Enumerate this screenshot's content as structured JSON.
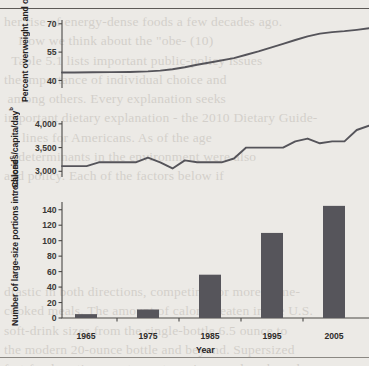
{
  "figure": {
    "background_color": "#eceae6",
    "ink_color": "#4a4845",
    "series_color": "#55545a",
    "bar_color": "#56555b",
    "bleed_text": "her rise of energy-dense foods a few decades ago.\n    How we think about the \"obe- (10)\n  Table 5.1 lists important public-policy issues\nthe importance of individual choice and\n among others. Every explanation seeks\nimportant dietary explanation - the 2010 Dietary Guide-\n     lines for Americans. As of the age\n    determinants in the environment were also\nand policy. Each of the factors below if\n\n\n\n\n\ndrastic in both directions, competing for more home-\ncooked meals. The amount of calories eaten in the U.S.\nsoft-drink sizes from the single-bottle 6.5 ounce to\nthe modern 20-ounce bottle and beyond. Supersized\nfast-food portions, restaurant servings, and packaged\nand snack foods grew alongside. Obesity rose in parallel."
  },
  "chart_data": [
    {
      "type": "line",
      "id": "panel-overweight",
      "title": "",
      "ylabel": "Percent overweight and obese",
      "ylabel_superscript": "a",
      "xlabel": "",
      "yticks": [
        40,
        55,
        70
      ],
      "ytick_labels": [
        "40",
        "55",
        "70"
      ],
      "ylim": [
        36,
        72
      ],
      "xlim": [
        1960,
        2010
      ],
      "grid": false,
      "x": [
        1960,
        1962,
        1965,
        1968,
        1971,
        1974,
        1976,
        1978,
        1980,
        1982,
        1985,
        1988,
        1990,
        1992,
        1994,
        1996,
        1998,
        2000,
        2002,
        2004,
        2006,
        2008,
        2010
      ],
      "values": [
        44.2,
        44.2,
        44.3,
        44.4,
        44.5,
        44.8,
        45.2,
        45.9,
        47.0,
        48.3,
        50.0,
        51.8,
        53.6,
        55.4,
        57.4,
        59.4,
        61.4,
        63.3,
        64.8,
        65.6,
        66.1,
        66.8,
        67.6
      ]
    },
    {
      "type": "line",
      "id": "panel-calories",
      "title": "",
      "ylabel": "Calories/capita/day",
      "ylabel_superscript": "b",
      "xlabel": "",
      "yticks": [
        3000,
        3500,
        4000
      ],
      "ytick_labels": [
        "3,000",
        "3,500",
        "4,000"
      ],
      "ylim": [
        2880,
        4060
      ],
      "xlim": [
        1960,
        2010
      ],
      "grid": false,
      "x": [
        1960,
        1962,
        1964,
        1966,
        1968,
        1970,
        1972,
        1974,
        1976,
        1978,
        1980,
        1982,
        1984,
        1986,
        1988,
        1990,
        1992,
        1994,
        1996,
        1998,
        2000,
        2002,
        2004,
        2006,
        2008,
        2010
      ],
      "values": [
        3110,
        3110,
        3110,
        3190,
        3190,
        3190,
        3190,
        3290,
        3190,
        3060,
        3230,
        3190,
        3190,
        3190,
        3270,
        3500,
        3500,
        3500,
        3500,
        3630,
        3690,
        3590,
        3630,
        3630,
        3870,
        3960
      ]
    },
    {
      "type": "bar",
      "id": "panel-portions",
      "title": "",
      "ylabel": "Number of large-size portions introduced",
      "ylabel_superscript": "c",
      "xlabel": "Year",
      "categories": [
        "1965",
        "1975",
        "1985",
        "1995",
        "2005"
      ],
      "values": [
        5,
        11,
        56,
        110,
        145
      ],
      "yticks": [
        0,
        20,
        40,
        60,
        80,
        100,
        120,
        140
      ],
      "ytick_labels": [
        "0",
        "20",
        "40",
        "60",
        "80",
        "100",
        "120",
        "140"
      ],
      "ylim": [
        0,
        150
      ],
      "grid": false
    }
  ]
}
